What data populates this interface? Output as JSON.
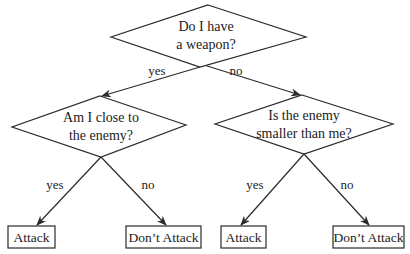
{
  "diagram": {
    "type": "decision-tree",
    "colors": {
      "line": "#2a2a2a",
      "text": "#222222",
      "background": "#ffffff"
    },
    "nodes": {
      "root": {
        "line1": "Do I have",
        "line2": "a weapon?"
      },
      "left": {
        "line1": "Am I close to",
        "line2": "the enemy?"
      },
      "right": {
        "line1": "Is the enemy",
        "line2": "smaller than me?"
      }
    },
    "edges": {
      "root_yes": "yes",
      "root_no": "no",
      "left_yes": "yes",
      "left_no": "no",
      "right_yes": "yes",
      "right_no": "no"
    },
    "leaves": {
      "ll": "Attack",
      "lr": "Don’t Attack",
      "rl": "Attack",
      "rr": "Don’t Attack"
    }
  }
}
